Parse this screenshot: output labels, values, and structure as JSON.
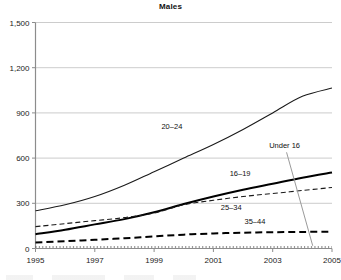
{
  "chart_data": {
    "type": "line",
    "title": "Males",
    "xlabel": "",
    "ylabel": "",
    "x": [
      1995,
      1996,
      1997,
      1998,
      1999,
      2000,
      2001,
      2002,
      2003,
      2004,
      2005
    ],
    "xtick_labels": [
      "1995",
      "1997",
      "1999",
      "2001",
      "2003",
      "2005"
    ],
    "xticks": [
      1995,
      1997,
      1999,
      2001,
      2003,
      2005
    ],
    "xlim": [
      1995,
      2005
    ],
    "ylim": [
      0,
      1500
    ],
    "yticks": [
      0,
      300,
      600,
      900,
      1200,
      1500
    ],
    "ytick_labels": [
      "0",
      "300",
      "600",
      "900",
      "1,200",
      "1,500"
    ],
    "grid": "horizontal",
    "legend": "inline-annotations",
    "series": [
      {
        "name": "20–24",
        "label": "20–24",
        "style": "solid-thin",
        "color": "#1a1a1a",
        "values": [
          250,
          290,
          345,
          420,
          510,
          600,
          690,
          790,
          900,
          1010,
          1065
        ]
      },
      {
        "name": "16–19",
        "label": "16–19",
        "style": "solid-thick",
        "color": "#000000",
        "values": [
          95,
          125,
          160,
          195,
          240,
          295,
          345,
          390,
          430,
          470,
          505
        ]
      },
      {
        "name": "25–34",
        "label": "25–34",
        "style": "dashed-thin",
        "color": "#1a1a1a",
        "values": [
          145,
          165,
          185,
          205,
          235,
          290,
          320,
          345,
          365,
          385,
          405
        ]
      },
      {
        "name": "35–44",
        "label": "35–44",
        "style": "dashed-thick",
        "color": "#000000",
        "values": [
          40,
          48,
          58,
          68,
          80,
          92,
          100,
          105,
          108,
          110,
          112
        ]
      },
      {
        "name": "Under 16",
        "label": "Under 16",
        "style": "dotted",
        "color": "#333333",
        "values": [
          10,
          10,
          10,
          10,
          10,
          10,
          10,
          10,
          10,
          10,
          10
        ]
      }
    ],
    "annotations": [
      {
        "text": "20–24",
        "x": 1999.6,
        "y": 790,
        "leader": false
      },
      {
        "text": "16–19",
        "x": 2001.9,
        "y": 480,
        "leader": false
      },
      {
        "text": "25–34",
        "x": 2001.6,
        "y": 255,
        "leader": false
      },
      {
        "text": "35–44",
        "x": 2002.4,
        "y": 160,
        "leader": false
      },
      {
        "text": "Under 16",
        "x": 2003.4,
        "y": 665,
        "leader": true
      }
    ]
  },
  "colors": {
    "axis": "#8c8c8c",
    "grid": "#bfbfbf",
    "ink": "#1a1a1a",
    "leader": "#9a9a9a",
    "background": "#ffffff"
  }
}
